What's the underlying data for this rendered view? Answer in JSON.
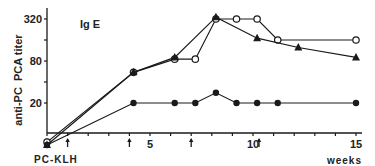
{
  "chart_data": {
    "type": "line",
    "title": "Ig E",
    "xlabel": "weeks",
    "ylabel": "anti-PC  PCA titer",
    "y_scale": "log",
    "xlim": [
      0,
      15.5
    ],
    "ylim": [
      5,
      400
    ],
    "x_ticks": [
      0,
      1,
      2,
      3,
      4,
      5,
      6,
      7,
      8,
      9,
      10,
      11,
      12,
      13,
      14,
      15
    ],
    "x_tick_labels": [
      {
        "x": 5,
        "label": "5"
      },
      {
        "x": 10,
        "label": "10"
      },
      {
        "x": 15,
        "label": "15"
      }
    ],
    "y_ticks": [
      {
        "value": 20,
        "label": "20"
      },
      {
        "value": 40,
        "label": ""
      },
      {
        "value": 80,
        "label": "80"
      },
      {
        "value": 160,
        "label": ""
      },
      {
        "value": 320,
        "label": "320"
      }
    ],
    "grid": false,
    "annotations": {
      "immunization_label": "PC-KLH",
      "immunization_weeks": [
        0,
        1,
        4,
        7,
        10
      ]
    },
    "series": [
      {
        "name": "open circles",
        "marker": "open-circle",
        "x": [
          0,
          4.2,
          6.2,
          7.2,
          8.2,
          9.2,
          10.2,
          11.2,
          15
        ],
        "y": [
          5.5,
          55,
          85,
          85,
          320,
          320,
          320,
          160,
          160
        ]
      },
      {
        "name": "filled triangles",
        "marker": "triangle",
        "x": [
          0,
          4.2,
          6.2,
          8.2,
          10.2,
          12.2,
          15
        ],
        "y": [
          5,
          55,
          90,
          340,
          170,
          125,
          90
        ]
      },
      {
        "name": "filled circles",
        "marker": "filled-circle",
        "x": [
          0,
          4.2,
          6.2,
          7.2,
          8.2,
          9.2,
          10.2,
          11.2,
          15
        ],
        "y": [
          5,
          20,
          20,
          20,
          28,
          20,
          20,
          20,
          20
        ]
      }
    ]
  }
}
